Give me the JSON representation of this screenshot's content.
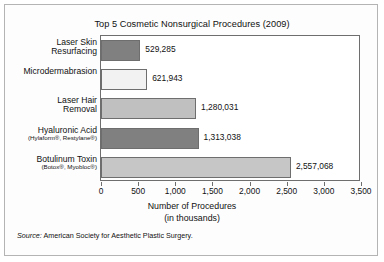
{
  "chart_data": {
    "type": "bar",
    "orientation": "horizontal",
    "title": "Top 5 Cosmetic Nonsurgical Procedures (2009)",
    "xlabel": "Number of Procedures",
    "xlabel_sub": "(in thousands)",
    "ylabel": "",
    "xlim": [
      0,
      3500
    ],
    "grid": false,
    "legend": "none",
    "tick_labels": [
      "0",
      "500",
      "1,000",
      "1,500",
      "2,000",
      "2,500",
      "3,000",
      "3,500"
    ],
    "tick_values": [
      0,
      500,
      1000,
      1500,
      2000,
      2500,
      3000,
      3500
    ],
    "categories": [
      "Laser Skin Resurfacing",
      "Microdermabrasion",
      "Laser Hair Removal",
      "Hyaluronic Acid",
      "Botulinum Toxin"
    ],
    "values": [
      529.285,
      621.943,
      1280.031,
      1313.038,
      2557.068
    ],
    "bars": [
      {
        "label_line1": "Laser Skin",
        "label_line2": "Resurfacing",
        "sublabel": "",
        "value": 529.285,
        "value_label": "529,285",
        "color": "#808080"
      },
      {
        "label_line1": "Microdermabrasion",
        "label_line2": "",
        "sublabel": "",
        "value": 621.943,
        "value_label": "621,943",
        "color": "#f2f2f2"
      },
      {
        "label_line1": "Laser Hair",
        "label_line2": "Removal",
        "sublabel": "",
        "value": 1280.031,
        "value_label": "1,280,031",
        "color": "#c0c0c0"
      },
      {
        "label_line1": "Hyaluronic Acid",
        "label_line2": "",
        "sublabel": "(Hylaform®, Restylane®)",
        "value": 1313.038,
        "value_label": "1,313,038",
        "color": "#808080"
      },
      {
        "label_line1": "Botulinum Toxin",
        "label_line2": "",
        "sublabel": "(Botox®, Myobloc®)",
        "value": 2557.068,
        "value_label": "2,557,068",
        "color": "#c6c6c6"
      }
    ],
    "source_prefix": "Source:",
    "source_text": "American Society for Aesthetic Plastic Surgery."
  }
}
